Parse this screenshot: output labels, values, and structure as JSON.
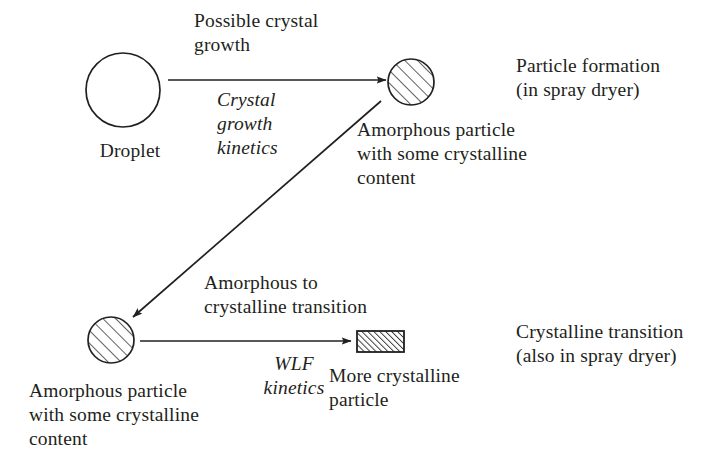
{
  "diagram": {
    "colors": {
      "ink": "#231f20",
      "background": "#ffffff",
      "hatch": "#3a3a3a"
    },
    "labels": {
      "possible_crystal_growth": "Possible crystal\ngrowth",
      "crystal_growth_kinetics": "Crystal\ngrowth\nkinetics",
      "droplet": "Droplet",
      "particle_formation": "Particle formation\n(in spray dryer)",
      "amorphous_particle_top": "Amorphous particle\nwith some crystalline\ncontent",
      "amorphous_to_crystalline": "Amorphous to\ncrystalline transition",
      "wlf_kinetics": "WLF\nkinetics",
      "more_crystalline_particle": "More crystalline\nparticle",
      "crystalline_transition": "Crystalline transition\n(also in spray dryer)",
      "amorphous_particle_bottom": "Amorphous particle\nwith some crystalline\ncontent"
    },
    "nodes": [
      {
        "name": "droplet-circle",
        "shape": "circle-outline",
        "cx": 123,
        "cy": 90,
        "r": 37,
        "fill": "none",
        "label": "Droplet"
      },
      {
        "name": "amorphous-particle-circle-top",
        "shape": "circle-hatched",
        "cx": 411,
        "cy": 82,
        "r": 23,
        "fill": "diagonal-hatch",
        "label": "Amorphous particle with some crystalline content"
      },
      {
        "name": "amorphous-particle-circle-bottom",
        "shape": "circle-hatched",
        "cx": 111,
        "cy": 340,
        "r": 23,
        "fill": "diagonal-hatch",
        "label": "Amorphous particle with some crystalline content"
      },
      {
        "name": "more-crystalline-rectangle",
        "shape": "rect-hatched",
        "x": 357,
        "y": 331,
        "width": 47,
        "height": 21,
        "fill": "dense-diagonal-hatch",
        "label": "More crystalline particle"
      }
    ],
    "arrows": [
      {
        "name": "arrow-crystal-growth",
        "from": "droplet-circle",
        "to": "amorphous-particle-circle-top",
        "x1": 168,
        "y1": 80,
        "x2": 386,
        "y2": 80,
        "direction": "right",
        "labels": [
          "Possible crystal growth",
          "Crystal growth kinetics"
        ]
      },
      {
        "name": "arrow-particle-to-amorphous",
        "from": "amorphous-particle-circle-top",
        "to": "amorphous-particle-circle-bottom",
        "x1": 381,
        "y1": 103,
        "x2": 134,
        "y2": 318,
        "direction": "down-left",
        "labels": []
      },
      {
        "name": "arrow-wlf-transition",
        "from": "amorphous-particle-circle-bottom",
        "to": "more-crystalline-rectangle",
        "x1": 140,
        "y1": 341,
        "x2": 351,
        "y2": 341,
        "direction": "right",
        "labels": [
          "Amorphous to crystalline transition",
          "WLF kinetics"
        ]
      }
    ]
  }
}
